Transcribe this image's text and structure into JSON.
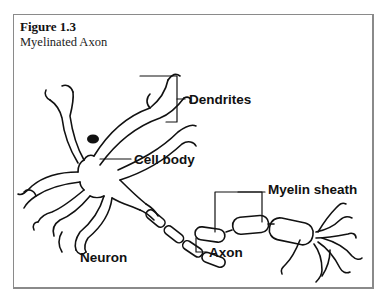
{
  "figure": {
    "number": "Figure 1.3",
    "title": "Myelinated Axon"
  },
  "diagram": {
    "subject": "Neuron",
    "labels": {
      "dendrites": "Dendrites",
      "cell_body": "Cell body",
      "myelin_sheath": "Myelin sheath",
      "axon": "Axon",
      "neuron": "Neuron"
    },
    "colors": {
      "line": "#111111",
      "frame": "#8a8a8a",
      "nucleus": "#111111"
    }
  }
}
